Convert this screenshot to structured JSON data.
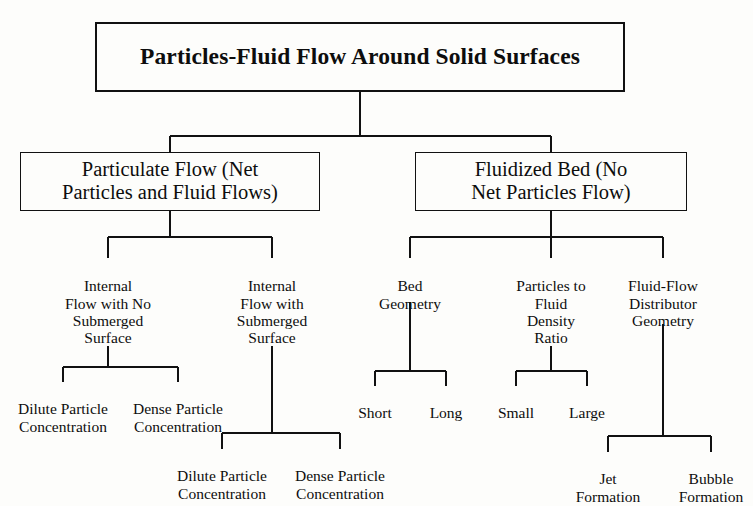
{
  "diagram": {
    "title": "Particles-Fluid Flow Around Solid Surfaces",
    "type": "classification-tree",
    "colors": {
      "background": "#fdfdfb",
      "text": "#0d0d0d",
      "line": "#111111"
    },
    "root": {
      "label": "Particles-Fluid Flow Around Solid Surfaces"
    },
    "branches": {
      "particulate_flow": {
        "label": "Particulate Flow (Net\nParticles and Fluid Flows)"
      },
      "fluidized_bed": {
        "label": "Fluidized Bed (No\nNet Particles Flow)"
      }
    },
    "factors": {
      "internal_no_submerged": {
        "label": "Internal\nFlow with No\nSubmerged\nSurface"
      },
      "internal_submerged": {
        "label": "Internal\nFlow with\nSubmerged\nSurface"
      },
      "bed_geometry": {
        "label": "Bed\nGeometry"
      },
      "density_ratio": {
        "label": "Particles to\nFluid\nDensity\nRatio"
      },
      "distributor_geometry": {
        "label": "Fluid-Flow\nDistributor\nGeometry"
      }
    },
    "leaves": {
      "dilute_upper": {
        "label": "Dilute Particle\nConcentration"
      },
      "dense_upper": {
        "label": "Dense Particle\nConcentration"
      },
      "dilute_lower": {
        "label": "Dilute Particle\nConcentration"
      },
      "dense_lower": {
        "label": "Dense Particle\nConcentration"
      },
      "short": {
        "label": "Short"
      },
      "long": {
        "label": "Long"
      },
      "small": {
        "label": "Small"
      },
      "large": {
        "label": "Large"
      },
      "jet_formation": {
        "label": "Jet\nFormation"
      },
      "bubble_formation": {
        "label": "Bubble\nFormation"
      }
    }
  }
}
